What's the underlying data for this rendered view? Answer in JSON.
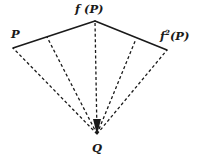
{
  "figure": {
    "background_color": "#ffffff",
    "stroke_color": "#1a1a1a",
    "width": 198,
    "height": 162
  },
  "labels": {
    "apex": "Q",
    "left_point": "P",
    "top_point_prefix": "f",
    "top_point": "f (P)",
    "right_point_base": "f",
    "right_point_exponent": "2",
    "right_point_suffix": "(P)"
  },
  "geometry": {
    "vertex_q": {
      "x": 97,
      "y": 134,
      "name": "Q"
    },
    "arc_points": [
      {
        "x": 13,
        "y": 48,
        "name": "P"
      },
      {
        "x": 95,
        "y": 21,
        "name": "f(P)"
      },
      {
        "x": 167,
        "y": 50,
        "name": "f2(P)"
      }
    ],
    "solid_edges": [
      {
        "from": "P",
        "to": "f(P)"
      },
      {
        "from": "f(P)",
        "to": "f2(P)"
      }
    ],
    "dashed_rays": [
      {
        "from": "Q",
        "to_x": 13,
        "to_y": 48,
        "label": "ray-to-P"
      },
      {
        "from": "Q",
        "to_x": 47,
        "to_y": 37,
        "label": "ray-1"
      },
      {
        "from": "Q",
        "to_x": 95,
        "to_y": 21,
        "label": "ray-to-fP"
      },
      {
        "from": "Q",
        "to_x": 136,
        "to_y": 39,
        "label": "ray-2"
      },
      {
        "from": "Q",
        "to_x": 167,
        "to_y": 50,
        "label": "ray-to-f2P"
      }
    ],
    "dash_pattern": "3 2.4",
    "solid_stroke_width": 1.5,
    "dashed_stroke_width": 1.3
  }
}
